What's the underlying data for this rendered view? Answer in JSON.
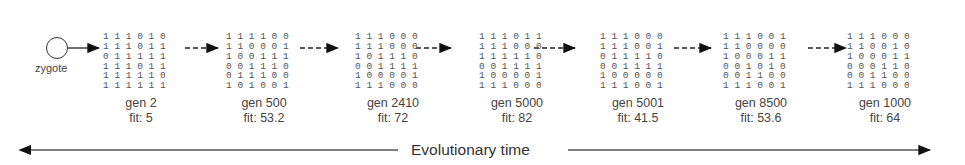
{
  "zygote": {
    "label": "zygote"
  },
  "stages": [
    {
      "gen": "gen 2",
      "fit": "fit: 5",
      "matrix": [
        "1 1 1 0 1 0",
        "1 1 1 0 1 1",
        "0 1 1 1 1 1",
        "1 1 1 0 1 1",
        "1 1 1 1 1 0",
        "1 1 1 1 1 1"
      ]
    },
    {
      "gen": "gen 500",
      "fit": "fit: 53.2",
      "matrix": [
        "1 1 1 1 0 0",
        "1 1 0 0 0 1",
        "1 0 0 1 1 1",
        "0 0 1 1 1 0",
        "0 1 1 1 0 0",
        "1 0 1 0 0 1"
      ]
    },
    {
      "gen": "gen 2410",
      "fit": "fit: 72",
      "matrix": [
        "1 1 1 0 0 0",
        "1 1 1 0 0 0",
        "1 0 1 1 1 0",
        "0 0 1 1 1 1",
        "1 0 0 0 0 1",
        "1 1 1 0 0 0"
      ]
    },
    {
      "gen": "gen 5000",
      "fit": "fit: 82",
      "matrix": [
        "1 1 1 0 1 1",
        "1 1 1 0 0 0",
        "1 1 1 1 1 0",
        "0 0 1 1 1 1",
        "1 0 0 0 0 1",
        "1 1 1 0 0 0"
      ]
    },
    {
      "gen": "gen 5001",
      "fit": "fit: 41.5",
      "matrix": [
        "1 1 1 0 0 0",
        "1 1 1 0 0 1",
        "0 1 1 1 1 0",
        "0 0 1 1 1 1",
        "1 0 0 0 0 0",
        "1 1 1 0 0 1"
      ]
    },
    {
      "gen": "gen 8500",
      "fit": "fit: 53.6",
      "matrix": [
        "1 1 1 0 0 1",
        "1 1 0 0 0 0",
        "1 0 0 0 1 1",
        "0 0 1 0 1 0",
        "0 0 1 1 0 0",
        "1 1 1 0 0 1"
      ]
    },
    {
      "gen": "gen 1000",
      "fit": "fit: 64",
      "matrix": [
        "1 1 1 0 0 0",
        "1 1 0 0 1 0",
        "1 0 0 0 1 1",
        "0 0 0 1 1 0",
        "0 0 1 1 0 0",
        "1 1 1 0 0 0"
      ]
    }
  ],
  "timeline": {
    "label": "Evolutionary time"
  }
}
